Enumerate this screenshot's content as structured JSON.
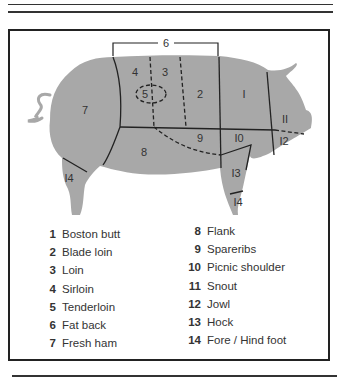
{
  "diagram": {
    "colors": {
      "body_fill": "#a8a8a8",
      "line": "#222222",
      "frame": "#222222"
    },
    "labels_on_pig": [
      {
        "id": "6",
        "text": "6"
      },
      {
        "id": "4",
        "text": "4"
      },
      {
        "id": "3",
        "text": "3"
      },
      {
        "id": "5",
        "text": "5"
      },
      {
        "id": "2",
        "text": "2"
      },
      {
        "id": "1",
        "text": "I"
      },
      {
        "id": "7",
        "text": "7"
      },
      {
        "id": "11",
        "text": "II"
      },
      {
        "id": "9",
        "text": "9"
      },
      {
        "id": "10",
        "text": "I0"
      },
      {
        "id": "12",
        "text": "I2"
      },
      {
        "id": "8",
        "text": "8"
      },
      {
        "id": "13",
        "text": "I3"
      },
      {
        "id": "14a",
        "text": "I4"
      },
      {
        "id": "14b",
        "text": "I4"
      }
    ]
  },
  "legend": {
    "left": [
      {
        "num": "1",
        "label": "Boston butt"
      },
      {
        "num": "2",
        "label": "Blade loin"
      },
      {
        "num": "3",
        "label": "Loin"
      },
      {
        "num": "4",
        "label": "Sirloin"
      },
      {
        "num": "5",
        "label": "Tenderloin"
      },
      {
        "num": "6",
        "label": "Fat back"
      },
      {
        "num": "7",
        "label": "Fresh ham"
      }
    ],
    "right": [
      {
        "num": "8",
        "label": "Flank"
      },
      {
        "num": "9",
        "label": "Spareribs"
      },
      {
        "num": "10",
        "label": "Picnic shoulder"
      },
      {
        "num": "11",
        "label": "Snout"
      },
      {
        "num": "12",
        "label": "Jowl"
      },
      {
        "num": "13",
        "label": "Hock"
      },
      {
        "num": "14",
        "label": "Fore / Hind foot"
      }
    ]
  }
}
